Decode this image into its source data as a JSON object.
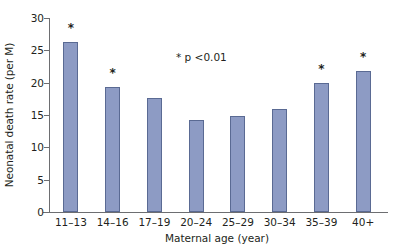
{
  "chart_data": {
    "type": "bar",
    "title": "",
    "xlabel": "Maternal age (year)",
    "ylabel": "Neonatal death rate (per M)",
    "categories": [
      "11–13",
      "14–16",
      "17–19",
      "20–24",
      "25–29",
      "30–34",
      "35–39",
      "40+"
    ],
    "values": [
      26.3,
      19.3,
      17.6,
      14.3,
      14.8,
      16.0,
      19.9,
      21.8
    ],
    "significance_markers": [
      "*",
      "*",
      "",
      "",
      "",
      "",
      "*",
      "*"
    ],
    "ylim": [
      0,
      30
    ],
    "yticks": [
      0,
      5,
      10,
      15,
      20,
      25,
      30
    ],
    "ytick_labels": [
      "0",
      "5",
      "10",
      "15",
      "20",
      "25",
      "30"
    ],
    "grid": false,
    "legend": "none",
    "annotations": [
      {
        "name": "significance-note",
        "text": "* p <0.01"
      }
    ],
    "colors": {
      "bar_fill": "#8d9bc4",
      "bar_edge": "#5a6a93",
      "axis": "#6d6e71",
      "text": "#231f20",
      "background": "#ffffff"
    }
  }
}
